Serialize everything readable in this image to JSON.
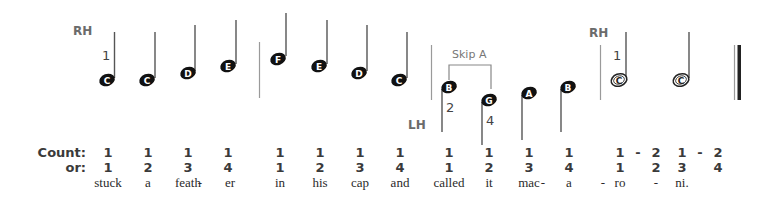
{
  "labels": {
    "rh_1": "RH",
    "rh_2": "RH",
    "lh": "LH",
    "skip": "Skip A"
  },
  "fingerings": {
    "rh_first": "1",
    "lh_b": "2",
    "lh_g": "4",
    "rh_second": "1"
  },
  "notes": [
    {
      "letter": "C",
      "type": "quarter",
      "hand": "RH"
    },
    {
      "letter": "C",
      "type": "quarter",
      "hand": "RH"
    },
    {
      "letter": "D",
      "type": "quarter",
      "hand": "RH"
    },
    {
      "letter": "E",
      "type": "quarter",
      "hand": "RH"
    },
    {
      "letter": "F",
      "type": "quarter",
      "hand": "RH"
    },
    {
      "letter": "E",
      "type": "quarter",
      "hand": "RH"
    },
    {
      "letter": "D",
      "type": "quarter",
      "hand": "RH"
    },
    {
      "letter": "C",
      "type": "quarter",
      "hand": "RH"
    },
    {
      "letter": "B",
      "type": "quarter",
      "hand": "LH"
    },
    {
      "letter": "G",
      "type": "quarter",
      "hand": "LH"
    },
    {
      "letter": "A",
      "type": "quarter",
      "hand": "LH"
    },
    {
      "letter": "B",
      "type": "quarter",
      "hand": "LH"
    },
    {
      "letter": "C",
      "type": "half",
      "hand": "RH"
    },
    {
      "letter": "C",
      "type": "half",
      "hand": "RH"
    }
  ],
  "counting": {
    "count_label": "Count:",
    "or_label": "or:",
    "count_row": [
      "1",
      "1",
      "1",
      "1",
      "1",
      "1",
      "1",
      "1",
      "1",
      "1",
      "1",
      "1",
      "1",
      "-",
      "2",
      "1",
      "-",
      "2"
    ],
    "or_row": [
      "1",
      "2",
      "3",
      "4",
      "1",
      "2",
      "3",
      "4",
      "1",
      "2",
      "3",
      "4",
      "1",
      "2",
      "3",
      "4"
    ]
  },
  "lyrics": [
    "stuck",
    "a",
    "feath",
    "-",
    "er",
    "in",
    "his",
    "cap",
    "and",
    "called",
    "it",
    "mac",
    "-",
    "a",
    "-",
    "ro",
    "-",
    "ni."
  ]
}
